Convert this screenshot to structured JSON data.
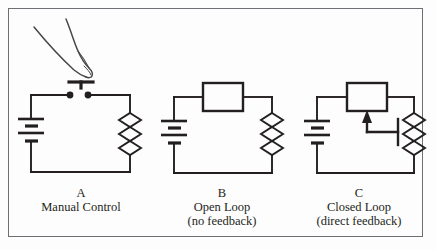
{
  "figure": {
    "background_color": "#fdfdfd",
    "line_color": "#231f20",
    "border_color": "#6e6e74"
  },
  "captions": {
    "a": {
      "letter": "A",
      "line1": "Manual Control",
      "line2": ""
    },
    "b": {
      "letter": "B",
      "line1": "Open Loop",
      "line2": "(no feedback)"
    },
    "c": {
      "letter": "C",
      "line1": "Closed Loop",
      "line2": "(direct feedback)"
    }
  },
  "circuits": [
    {
      "id": "a",
      "label": "A",
      "name": "Manual Control",
      "components": [
        {
          "type": "battery",
          "name": "battery-symbol"
        },
        {
          "type": "switch",
          "name": "pushbutton-switch"
        },
        {
          "type": "resistor",
          "name": "resistor-symbol"
        },
        {
          "type": "hand",
          "name": "finger-pressing-switch"
        }
      ],
      "has_feedback": false
    },
    {
      "id": "b",
      "label": "B",
      "name": "Open Loop",
      "sublabel": "(no feedback)",
      "components": [
        {
          "type": "battery",
          "name": "battery-symbol"
        },
        {
          "type": "controller",
          "name": "controller-box"
        },
        {
          "type": "resistor",
          "name": "resistor-symbol"
        }
      ],
      "has_feedback": false
    },
    {
      "id": "c",
      "label": "C",
      "name": "Closed Loop",
      "sublabel": "(direct feedback)",
      "components": [
        {
          "type": "battery",
          "name": "battery-symbol"
        },
        {
          "type": "controller",
          "name": "controller-box"
        },
        {
          "type": "resistor",
          "name": "resistor-symbol"
        },
        {
          "type": "feedback",
          "name": "feedback-arrow"
        },
        {
          "type": "sensor-tap",
          "name": "sensor-tap-bar"
        }
      ],
      "has_feedback": true
    }
  ]
}
